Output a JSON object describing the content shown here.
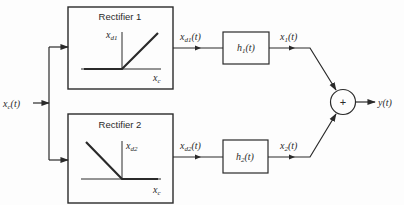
{
  "diagram": {
    "input": {
      "label": "x",
      "sub": "c",
      "arg": "(t)"
    },
    "rectifier1": {
      "title": "Rectifier 1",
      "y_axis": {
        "label": "x",
        "sub": "d1"
      },
      "x_axis": {
        "label": "x",
        "sub": "c"
      }
    },
    "rectifier2": {
      "title": "Rectifier 2",
      "y_axis": {
        "label": "x",
        "sub": "d2"
      },
      "x_axis": {
        "label": "x",
        "sub": "c"
      }
    },
    "signal_d1": {
      "label": "x",
      "sub": "d1",
      "arg": "(t)"
    },
    "signal_d2": {
      "label": "x",
      "sub": "d2",
      "arg": "(t)"
    },
    "filter1": {
      "label": "h",
      "sub": "1",
      "arg": "(t)"
    },
    "filter2": {
      "label": "h",
      "sub": "2",
      "arg": "(t)"
    },
    "signal_x1": {
      "label": "x",
      "sub": "1",
      "arg": "(t)"
    },
    "signal_x2": {
      "label": "x",
      "sub": "2",
      "arg": "(t)"
    },
    "summer": {
      "symbol": "+"
    },
    "output": {
      "label": "y(t)"
    }
  },
  "colors": {
    "line": "#2a2a2a",
    "background": "#fdfdfd"
  }
}
